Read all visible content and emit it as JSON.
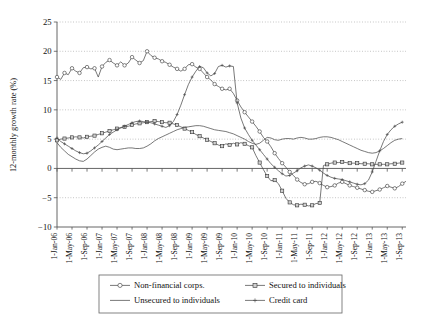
{
  "chart_data": {
    "type": "line",
    "title": "",
    "xlabel": "",
    "ylabel": "12-monthly growth rate (%)",
    "ylim": [
      -10,
      25
    ],
    "yticks": [
      -10,
      -5,
      0,
      5,
      10,
      15,
      20,
      25
    ],
    "ytick_labels": [
      "−10",
      "−5",
      "0",
      "5",
      "10",
      "15",
      "20",
      "25"
    ],
    "grid": true,
    "grid_axis": "y",
    "legend_position": "below-axes",
    "x_tick_labels": [
      "1-Jan-06",
      "1-May-06",
      "1-Sep-06",
      "1-Jan-07",
      "1-May-07",
      "1-Sep-07",
      "1-Jan-08",
      "1-May-08",
      "1-Sep-08",
      "1-Jan-09",
      "1-May-09",
      "1-Sep-09",
      "1-Jan-10",
      "1-May-10",
      "1-Sep-10",
      "1-Jan-11",
      "1-May-11",
      "1-Sep-11",
      "1-Jan-12",
      "1-May-12",
      "1-Sep-12",
      "1-Jan-13",
      "1-May-13",
      "1-Sep-13"
    ],
    "x_tick_rotation": 90,
    "x_start": "1-Jan-06",
    "x_end": "1-Sep-13",
    "n_points": 93,
    "series": [
      {
        "name": "Non-financial corps.",
        "marker": "open-diamond",
        "values": [
          15.6,
          15.2,
          16.3,
          16.0,
          17.1,
          16.6,
          16.3,
          17.2,
          17.3,
          17.0,
          17.1,
          15.6,
          17.4,
          18.1,
          18.5,
          18.0,
          17.6,
          18.2,
          17.6,
          18.0,
          19.0,
          18.5,
          18.0,
          18.4,
          20.0,
          19.3,
          18.9,
          18.7,
          18.3,
          18.1,
          17.7,
          17.3,
          17.0,
          16.6,
          17.0,
          17.7,
          17.8,
          17.3,
          17.0,
          16.3,
          15.6,
          15.1,
          14.4,
          14.0,
          13.6,
          13.4,
          13.6,
          12.8,
          11.6,
          10.5,
          9.6,
          8.8,
          8.0,
          7.2,
          6.3,
          5.3,
          4.6,
          3.7,
          2.6,
          1.7,
          0.9,
          0.2,
          -0.6,
          -1.2,
          -1.9,
          -2.4,
          -2.7,
          -2.6,
          -2.3,
          -2.2,
          -2.5,
          -2.9,
          -3.2,
          -3.1,
          -2.9,
          -2.5,
          -2.3,
          -2.6,
          -2.9,
          -3.1,
          -3.3,
          -3.5,
          -3.7,
          -3.9,
          -4.0,
          -3.8,
          -3.6,
          -3.3,
          -3.0,
          -3.2,
          -3.4,
          -3.1,
          -2.6,
          -2.2
        ]
      },
      {
        "name": "Secured to individuals",
        "marker": "square",
        "values": [
          4.8,
          5.0,
          5.1,
          5.2,
          5.3,
          5.4,
          5.3,
          5.2,
          5.4,
          5.5,
          5.6,
          5.8,
          6.0,
          6.2,
          6.4,
          6.6,
          6.8,
          7.0,
          7.1,
          7.2,
          7.4,
          7.6,
          7.7,
          7.8,
          7.9,
          8.0,
          8.1,
          8.0,
          7.9,
          7.8,
          7.8,
          7.6,
          7.4,
          7.1,
          6.8,
          6.5,
          6.2,
          5.8,
          5.5,
          5.2,
          4.9,
          4.6,
          4.3,
          4.0,
          3.8,
          4.2,
          4.0,
          4.3,
          4.1,
          4.4,
          4.2,
          3.9,
          3.6,
          2.2,
          1.0,
          -0.2,
          -1.3,
          -2.1,
          -2.0,
          -2.6,
          -3.8,
          -5.1,
          -5.8,
          -6.2,
          -6.3,
          -6.1,
          -6.2,
          -6.4,
          -6.3,
          -6.0,
          -5.9,
          0.5,
          0.7,
          0.9,
          1.0,
          1.0,
          1.1,
          1.0,
          0.9,
          0.9,
          0.9,
          0.8,
          0.8,
          0.8,
          0.7,
          0.7,
          0.7,
          0.7,
          0.7,
          0.8,
          0.8,
          0.9,
          1.0
        ]
      },
      {
        "name": "Unsecured to individuals",
        "marker": "none",
        "values": [
          4.4,
          3.6,
          3.0,
          2.4,
          2.0,
          1.6,
          1.3,
          1.2,
          1.6,
          2.2,
          2.8,
          3.3,
          3.6,
          3.8,
          3.6,
          3.3,
          3.2,
          3.3,
          3.4,
          3.5,
          3.5,
          3.4,
          3.4,
          3.5,
          3.8,
          4.2,
          4.7,
          5.1,
          5.4,
          5.7,
          6.0,
          6.3,
          6.6,
          6.8,
          7.0,
          7.1,
          7.2,
          7.3,
          7.3,
          7.2,
          7.0,
          6.8,
          6.6,
          6.5,
          6.4,
          6.3,
          6.1,
          5.9,
          5.6,
          5.3,
          5.0,
          4.6,
          4.3,
          4.1,
          4.3,
          4.8,
          5.3,
          5.2,
          4.9,
          4.8,
          5.0,
          5.1,
          5.1,
          5.0,
          5.2,
          5.3,
          5.2,
          5.0,
          5.0,
          5.1,
          5.3,
          5.4,
          5.4,
          5.3,
          5.1,
          4.9,
          4.6,
          4.3,
          4.0,
          3.7,
          3.4,
          3.1,
          2.9,
          2.7,
          2.6,
          2.7,
          3.0,
          3.4,
          3.9,
          4.4,
          4.8,
          5.0,
          5.1
        ]
      },
      {
        "name": "Credit card",
        "marker": "cross",
        "values": [
          5.2,
          4.6,
          4.2,
          3.8,
          3.4,
          3.0,
          2.7,
          2.5,
          2.6,
          3.0,
          3.5,
          4.0,
          4.6,
          5.2,
          5.8,
          6.2,
          6.6,
          6.9,
          7.2,
          7.5,
          7.8,
          8.0,
          8.1,
          8.0,
          7.9,
          7.8,
          7.6,
          7.4,
          7.2,
          7.0,
          7.3,
          8.0,
          9.2,
          10.8,
          12.6,
          14.3,
          15.6,
          16.6,
          17.4,
          17.2,
          16.3,
          15.8,
          16.2,
          17.4,
          17.6,
          17.3,
          17.5,
          17.4,
          11.2,
          8.6,
          6.9,
          5.8,
          4.8,
          4.0,
          3.2,
          2.4,
          1.6,
          0.8,
          0.2,
          -0.4,
          -0.9,
          -1.3,
          -1.2,
          -0.8,
          -0.4,
          0.1,
          0.4,
          0.6,
          0.4,
          0.1,
          -0.3,
          -0.8,
          -1.2,
          -1.5,
          -1.7,
          -1.8,
          -1.9,
          -2.1,
          -2.3,
          -2.5,
          -2.7,
          -2.8,
          -2.6,
          -2.0,
          -0.6,
          1.2,
          3.0,
          4.6,
          5.8,
          6.6,
          7.2,
          7.6,
          7.9
        ]
      }
    ]
  },
  "legend": {
    "entries": [
      {
        "label": "Non-financial corps.",
        "marker": "open-diamond"
      },
      {
        "label": "Secured to individuals",
        "marker": "square"
      },
      {
        "label": "Unsecured to individuals",
        "marker": "none"
      },
      {
        "label": "Credit card",
        "marker": "cross"
      }
    ]
  },
  "colors": {
    "series_stroke": "#444444",
    "grid": "#9a9a9a",
    "axis": "#555555",
    "background": "#ffffff"
  }
}
